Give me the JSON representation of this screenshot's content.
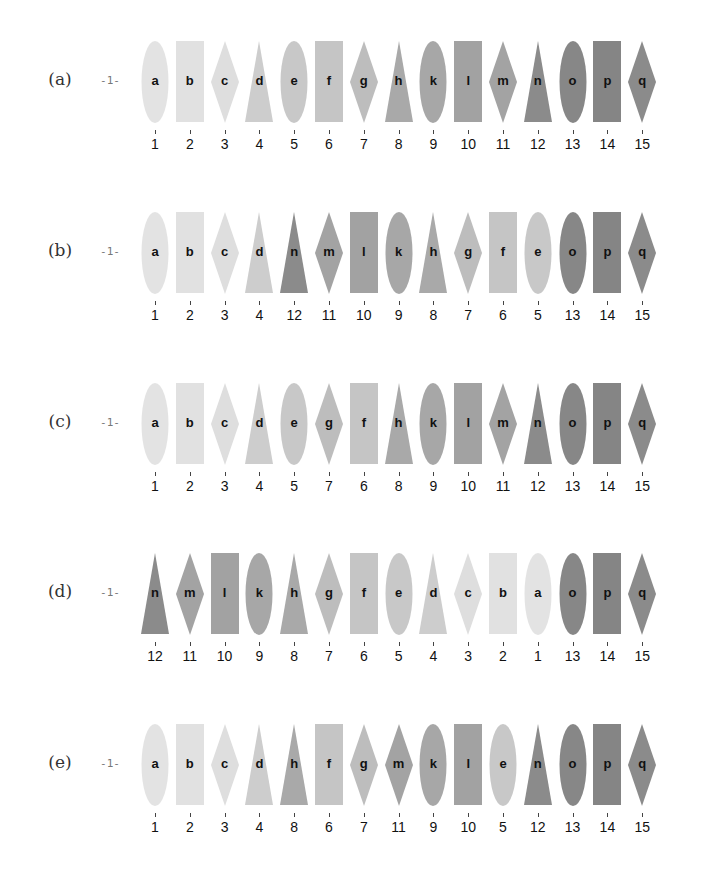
{
  "marker_label": "-1-",
  "shades": {
    "a": "#e3e3e3",
    "b": "#e1e1e1",
    "c": "#dedede",
    "d": "#cdcdcd",
    "e": "#c8c8c8",
    "f": "#c5c5c5",
    "g": "#bdbdbd",
    "h": "#a9a9a9",
    "k": "#a7a7a7",
    "l": "#a2a2a2",
    "m": "#a3a3a3",
    "n": "#8b8b8b",
    "o": "#878787",
    "p": "#858585",
    "q": "#8b8b8b"
  },
  "shapes": {
    "a": "ellipse",
    "b": "rect",
    "c": "diamond",
    "d": "triangle",
    "e": "ellipse",
    "f": "rect",
    "g": "diamond",
    "h": "triangle",
    "k": "ellipse",
    "l": "rect",
    "m": "diamond",
    "n": "triangle",
    "o": "ellipse",
    "p": "rect",
    "q": "diamond"
  },
  "rows": [
    {
      "label": "(a)",
      "items": [
        {
          "letter": "a",
          "number": "1"
        },
        {
          "letter": "b",
          "number": "2"
        },
        {
          "letter": "c",
          "number": "3"
        },
        {
          "letter": "d",
          "number": "4"
        },
        {
          "letter": "e",
          "number": "5"
        },
        {
          "letter": "f",
          "number": "6"
        },
        {
          "letter": "g",
          "number": "7"
        },
        {
          "letter": "h",
          "number": "8"
        },
        {
          "letter": "k",
          "number": "9"
        },
        {
          "letter": "l",
          "number": "10"
        },
        {
          "letter": "m",
          "number": "11"
        },
        {
          "letter": "n",
          "number": "12"
        },
        {
          "letter": "o",
          "number": "13"
        },
        {
          "letter": "p",
          "number": "14"
        },
        {
          "letter": "q",
          "number": "15"
        }
      ]
    },
    {
      "label": "(b)",
      "items": [
        {
          "letter": "a",
          "number": "1"
        },
        {
          "letter": "b",
          "number": "2"
        },
        {
          "letter": "c",
          "number": "3"
        },
        {
          "letter": "d",
          "number": "4"
        },
        {
          "letter": "n",
          "number": "12"
        },
        {
          "letter": "m",
          "number": "11"
        },
        {
          "letter": "l",
          "number": "10"
        },
        {
          "letter": "k",
          "number": "9"
        },
        {
          "letter": "h",
          "number": "8"
        },
        {
          "letter": "g",
          "number": "7"
        },
        {
          "letter": "f",
          "number": "6"
        },
        {
          "letter": "e",
          "number": "5"
        },
        {
          "letter": "o",
          "number": "13"
        },
        {
          "letter": "p",
          "number": "14"
        },
        {
          "letter": "q",
          "number": "15"
        }
      ]
    },
    {
      "label": "(c)",
      "items": [
        {
          "letter": "a",
          "number": "1"
        },
        {
          "letter": "b",
          "number": "2"
        },
        {
          "letter": "c",
          "number": "3"
        },
        {
          "letter": "d",
          "number": "4"
        },
        {
          "letter": "e",
          "number": "5"
        },
        {
          "letter": "g",
          "number": "7"
        },
        {
          "letter": "f",
          "number": "6"
        },
        {
          "letter": "h",
          "number": "8"
        },
        {
          "letter": "k",
          "number": "9"
        },
        {
          "letter": "l",
          "number": "10"
        },
        {
          "letter": "m",
          "number": "11"
        },
        {
          "letter": "n",
          "number": "12"
        },
        {
          "letter": "o",
          "number": "13"
        },
        {
          "letter": "p",
          "number": "14"
        },
        {
          "letter": "q",
          "number": "15"
        }
      ]
    },
    {
      "label": "(d)",
      "items": [
        {
          "letter": "n",
          "number": "12"
        },
        {
          "letter": "m",
          "number": "11"
        },
        {
          "letter": "l",
          "number": "10"
        },
        {
          "letter": "k",
          "number": "9"
        },
        {
          "letter": "h",
          "number": "8"
        },
        {
          "letter": "g",
          "number": "7"
        },
        {
          "letter": "f",
          "number": "6"
        },
        {
          "letter": "e",
          "number": "5"
        },
        {
          "letter": "d",
          "number": "4"
        },
        {
          "letter": "c",
          "number": "3"
        },
        {
          "letter": "b",
          "number": "2"
        },
        {
          "letter": "a",
          "number": "1"
        },
        {
          "letter": "o",
          "number": "13"
        },
        {
          "letter": "p",
          "number": "14"
        },
        {
          "letter": "q",
          "number": "15"
        }
      ]
    },
    {
      "label": "(e)",
      "items": [
        {
          "letter": "a",
          "number": "1"
        },
        {
          "letter": "b",
          "number": "2"
        },
        {
          "letter": "c",
          "number": "3"
        },
        {
          "letter": "d",
          "number": "4"
        },
        {
          "letter": "h",
          "number": "8"
        },
        {
          "letter": "f",
          "number": "6"
        },
        {
          "letter": "g",
          "number": "7"
        },
        {
          "letter": "m",
          "number": "11"
        },
        {
          "letter": "k",
          "number": "9"
        },
        {
          "letter": "l",
          "number": "10"
        },
        {
          "letter": "e",
          "number": "5"
        },
        {
          "letter": "n",
          "number": "12"
        },
        {
          "letter": "o",
          "number": "13"
        },
        {
          "letter": "p",
          "number": "14"
        },
        {
          "letter": "q",
          "number": "15"
        }
      ]
    }
  ]
}
